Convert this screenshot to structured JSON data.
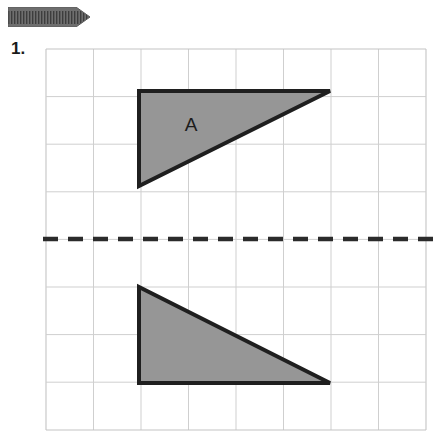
{
  "header": {
    "banner_icon": "hatched-arrow-ribbon",
    "banner_color": "#6e6e6e",
    "banner_hatch_color": "#3d3d3d"
  },
  "question": {
    "number_label": "1."
  },
  "figure": {
    "type": "reflection-diagram",
    "grid": {
      "columns": 8,
      "rows": 8,
      "left": 46,
      "top": 49,
      "right": 426,
      "bottom": 430,
      "cell_width": 47.5,
      "cell_height": 47.6,
      "line_color": "#c9c9c9",
      "border_color": "#bdbdbd"
    },
    "mirror_line": {
      "label": "mirror-line",
      "orientation": "horizontal",
      "y": 239,
      "x_start": 43,
      "x_end": 440,
      "color": "#2b2b2b",
      "dash": "14 9",
      "width": 4
    },
    "shapes": [
      {
        "name": "triangle-a",
        "label": "A",
        "label_x": 191,
        "label_y": 130,
        "points": "139,91 330,91 139,186",
        "fill": "#969696",
        "stroke": "#1f1f1f",
        "stroke_width": 4
      },
      {
        "name": "triangle-a-image",
        "label": "",
        "points": "139,287 139,383 330,383",
        "fill": "#969696",
        "stroke": "#1f1f1f",
        "stroke_width": 4
      }
    ]
  }
}
